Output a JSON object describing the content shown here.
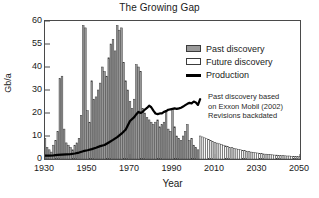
{
  "chart_data": {
    "type": "bar",
    "title": "The Growing Gap",
    "xlabel": "Year",
    "ylabel": "Gb/a",
    "xlim": [
      1930,
      2050
    ],
    "ylim": [
      0,
      60
    ],
    "grid": false,
    "legend_position": "upper-right",
    "xticks": [
      1930,
      1950,
      1970,
      1990,
      2010,
      2030,
      2050
    ],
    "yticks": [
      0,
      10,
      20,
      30,
      40,
      50,
      60
    ],
    "ytick_labels": [
      "0",
      "10",
      "20",
      "30",
      "40",
      "55",
      "60"
    ],
    "series": [
      {
        "name": "Past discovery",
        "type": "bar",
        "color": "#9a9a9a",
        "edge_color": "#3c3c3c",
        "x": [
          1930,
          1931,
          1932,
          1933,
          1934,
          1935,
          1936,
          1937,
          1938,
          1939,
          1940,
          1941,
          1942,
          1943,
          1944,
          1945,
          1946,
          1947,
          1948,
          1949,
          1950,
          1951,
          1952,
          1953,
          1954,
          1955,
          1956,
          1957,
          1958,
          1959,
          1960,
          1961,
          1962,
          1963,
          1964,
          1965,
          1966,
          1967,
          1968,
          1969,
          1970,
          1971,
          1972,
          1973,
          1974,
          1975,
          1976,
          1977,
          1978,
          1979,
          1980,
          1981,
          1982,
          1983,
          1984,
          1985,
          1986,
          1987,
          1988,
          1989,
          1990,
          1991,
          1992,
          1993,
          1994,
          1995,
          1996,
          1997,
          1998,
          1999,
          2000,
          2001,
          2002
        ],
        "values": [
          9,
          5,
          4,
          3,
          6,
          8,
          12,
          35,
          36,
          13,
          7,
          6,
          5,
          4,
          6,
          7,
          9,
          19,
          58,
          57,
          21,
          16,
          34,
          26,
          27,
          30,
          33,
          40,
          38,
          36,
          44,
          50,
          52,
          47,
          58,
          56,
          57,
          42,
          34,
          30,
          25,
          22,
          26,
          41,
          40,
          38,
          22,
          20,
          18,
          17,
          16,
          15,
          16,
          17,
          14,
          15,
          16,
          21,
          13,
          12,
          22,
          14,
          10,
          9,
          8,
          10,
          12,
          15,
          8,
          9,
          6,
          5,
          4
        ]
      },
      {
        "name": "Future discovery",
        "type": "bar",
        "color": "#ffffff",
        "edge_color": "#3c3c3c",
        "x": [
          2003,
          2004,
          2005,
          2006,
          2007,
          2008,
          2009,
          2010,
          2011,
          2012,
          2013,
          2014,
          2015,
          2016,
          2017,
          2018,
          2019,
          2020,
          2021,
          2022,
          2023,
          2024,
          2025,
          2026,
          2027,
          2028,
          2029,
          2030,
          2031,
          2032,
          2033,
          2034,
          2035,
          2036,
          2037,
          2038,
          2039,
          2040,
          2041,
          2042,
          2043,
          2044,
          2045,
          2046,
          2047,
          2048,
          2049,
          2050
        ],
        "values": [
          10,
          9.6,
          9.2,
          8.8,
          8.4,
          8.0,
          7.6,
          7.2,
          6.9,
          6.6,
          6.3,
          6.0,
          5.7,
          5.4,
          5.1,
          4.9,
          4.6,
          4.4,
          4.2,
          4.0,
          3.8,
          3.6,
          3.4,
          3.2,
          3.0,
          2.9,
          2.7,
          2.6,
          2.5,
          2.3,
          2.2,
          2.1,
          2.0,
          1.9,
          1.8,
          1.7,
          1.7,
          1.6,
          1.5,
          1.5,
          1.4,
          1.3,
          1.3,
          1.2,
          1.2,
          1.1,
          1.1,
          1.0
        ]
      },
      {
        "name": "Production",
        "type": "line",
        "color": "#000000",
        "x": [
          1930,
          1932,
          1934,
          1936,
          1938,
          1940,
          1942,
          1944,
          1946,
          1948,
          1950,
          1952,
          1954,
          1956,
          1958,
          1960,
          1962,
          1964,
          1966,
          1968,
          1970,
          1972,
          1973,
          1974,
          1975,
          1976,
          1977,
          1978,
          1979,
          1980,
          1981,
          1982,
          1983,
          1984,
          1985,
          1986,
          1987,
          1988,
          1989,
          1990,
          1991,
          1992,
          1993,
          1994,
          1995,
          1996,
          1997,
          1998,
          1999,
          2000,
          2001,
          2002,
          2003
        ],
        "values": [
          1.5,
          1.5,
          1.6,
          1.8,
          1.9,
          2.0,
          2.1,
          2.4,
          2.8,
          3.4,
          3.8,
          4.3,
          4.9,
          5.6,
          6.1,
          7.2,
          8.3,
          9.5,
          11.0,
          12.8,
          16.5,
          18.2,
          19.5,
          20.5,
          20.0,
          20.5,
          21.5,
          22.2,
          23.2,
          22.5,
          21.0,
          19.8,
          19.5,
          19.8,
          19.8,
          20.5,
          20.8,
          21.4,
          21.6,
          21.8,
          22.0,
          21.8,
          22.0,
          22.3,
          22.8,
          23.4,
          24.0,
          24.4,
          24.2,
          25.0,
          24.6,
          23.5,
          26.0
        ]
      }
    ],
    "annotation": {
      "lines": [
        "Past discovery based",
        "on Exxon Mobil (2002)",
        "Revisions backdated"
      ]
    }
  }
}
